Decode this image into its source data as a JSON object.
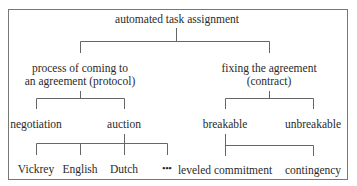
{
  "diagram": {
    "root": "automated task assignment",
    "protocol": {
      "line1": "process of coming to",
      "line2": "an agreement (protocol)",
      "children": {
        "negotiation": "negotiation",
        "auction": "auction"
      },
      "auction_types": [
        "Vickrey",
        "English",
        "Dutch",
        "•••"
      ]
    },
    "contract": {
      "line1": "fixing the agreement",
      "line2": "(contract)",
      "children": {
        "breakable": "breakable",
        "unbreakable": "unbreakable"
      },
      "breakable_types": [
        "leveled commitment",
        "contingency"
      ]
    }
  },
  "colors": {
    "line": "#666666",
    "text": "#2a2a2a",
    "border": "#777777"
  }
}
